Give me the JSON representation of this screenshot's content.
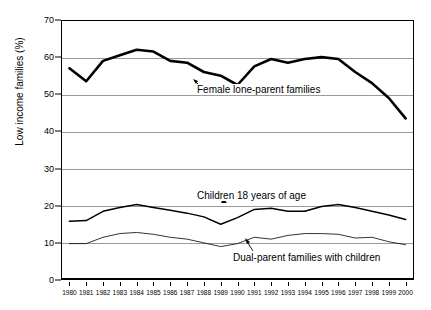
{
  "chart_data": {
    "type": "line",
    "title": "",
    "xlabel": "",
    "ylabel": "Low income families (%)",
    "ylim": [
      0,
      70
    ],
    "ytick_values": [
      0,
      10,
      20,
      30,
      40,
      50,
      60,
      70
    ],
    "ytick_labels": [
      "0",
      "10",
      "20",
      "30",
      "40",
      "50",
      "60",
      "70"
    ],
    "grid": true,
    "legend_position": "inline-annotations",
    "x": [
      1980,
      1981,
      1982,
      1983,
      1984,
      1985,
      1986,
      1987,
      1988,
      1989,
      1990,
      1991,
      1992,
      1993,
      1994,
      1995,
      1996,
      1997,
      1998,
      1999,
      2000
    ],
    "xtick_labels": [
      "1980",
      "1981",
      "1982",
      "1983",
      "1984",
      "1985",
      "1986",
      "1987",
      "1988",
      "1989",
      "1990",
      "1991",
      "1992",
      "1993",
      "1994",
      "1995",
      "1996",
      "1997",
      "1998",
      "1999",
      "2000"
    ],
    "series": [
      {
        "name": "Female lone-parent families",
        "style": "thick",
        "values": [
          57,
          53.5,
          59,
          60.5,
          62,
          61.5,
          59,
          58.5,
          56,
          55,
          52.5,
          57.5,
          59.5,
          58.5,
          59.5,
          60,
          59.5,
          56,
          53,
          49,
          43.5
        ]
      },
      {
        "name": "Children 18 years of age",
        "style": "medium",
        "values": [
          15.8,
          16,
          18.5,
          19.5,
          20.3,
          19.5,
          18.8,
          18,
          17,
          15,
          16.8,
          19,
          19.3,
          18.5,
          18.5,
          19.8,
          20.3,
          19.5,
          18.5,
          17.5,
          16.3
        ]
      },
      {
        "name": "Dual-parent families with children",
        "style": "thin",
        "values": [
          9.8,
          9.8,
          11.5,
          12.5,
          12.8,
          12.3,
          11.5,
          11,
          10,
          9,
          9.8,
          11.5,
          11,
          12,
          12.5,
          12.5,
          12.3,
          11.3,
          11.5,
          10.3,
          9.5
        ]
      }
    ],
    "annotations": [
      {
        "text": "Female lone-parent families",
        "points_to_series": "Female lone-parent families",
        "points_to_x": 1990
      },
      {
        "text": "Children 18 years of age",
        "points_to_series": "Children 18 years of age",
        "points_to_x": 1990
      },
      {
        "text": "Dual-parent families with children",
        "points_to_series": "Dual-parent families with children",
        "points_to_x": 1993
      }
    ],
    "colors": {
      "line": "#000000",
      "grid": "#9a9a9a",
      "background": "#ffffff"
    }
  }
}
